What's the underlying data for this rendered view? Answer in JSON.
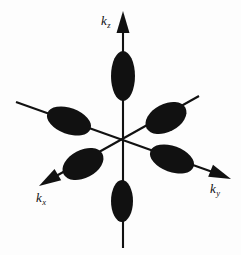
{
  "figure": {
    "background_color": "#fdfdfd",
    "ink_color": "#111111",
    "width": 241,
    "height": 255,
    "origin": {
      "x": 123,
      "y": 142
    }
  },
  "axes": [
    {
      "id": "kz",
      "label_main": "k",
      "label_sub": "z",
      "label_x": 101,
      "label_y": 25,
      "orientation": "vertical",
      "arrow": "up",
      "start": {
        "x": 123,
        "y": 248
      },
      "end": {
        "x": 123,
        "y": 18
      },
      "arrow_tip": {
        "x": 123,
        "y": 11
      }
    },
    {
      "id": "ky",
      "label_main": "k",
      "label_sub": "y",
      "label_x": 210,
      "label_y": 193,
      "orientation": "diagonal-down-right",
      "arrow": "down-right",
      "start": {
        "x": 16,
        "y": 102
      },
      "end": {
        "x": 221,
        "y": 175
      },
      "arrow_tip": {
        "x": 231,
        "y": 179
      }
    },
    {
      "id": "kx",
      "label_main": "k",
      "label_sub": "x",
      "label_x": 36,
      "label_y": 202,
      "orientation": "diagonal-down-left",
      "arrow": "down-left",
      "start": {
        "x": 199,
        "y": 96
      },
      "end": {
        "x": 49,
        "y": 180
      },
      "arrow_tip": {
        "x": 39,
        "y": 186
      }
    }
  ],
  "chart_data": {
    "type": "scatter",
    "xlabel": "k_y",
    "ylabel": "k_z",
    "zlabel": "k_x",
    "grid": false,
    "legend": false,
    "pockets": [
      {
        "name": "kz-positive-pocket",
        "axis": "kz",
        "sign": "+",
        "cx": 123,
        "cy": 76,
        "rx": 12,
        "ry": 25,
        "rotation": 0
      },
      {
        "name": "kz-negative-pocket",
        "axis": "kz",
        "sign": "-",
        "cx": 122,
        "cy": 201,
        "rx": 11,
        "ry": 21,
        "rotation": 0
      },
      {
        "name": "ky-negative-pocket",
        "axis": "ky",
        "sign": "-",
        "cx": 69,
        "cy": 121,
        "rx": 23,
        "ry": 13,
        "rotation": 20
      },
      {
        "name": "ky-positive-pocket",
        "axis": "ky",
        "sign": "+",
        "cx": 172,
        "cy": 159,
        "rx": 23,
        "ry": 13,
        "rotation": 20
      },
      {
        "name": "kx-positive-pocket",
        "axis": "kx",
        "sign": "+",
        "cx": 166,
        "cy": 118,
        "rx": 22,
        "ry": 14,
        "rotation": -28
      },
      {
        "name": "kx-negative-pocket",
        "axis": "kx",
        "sign": "-",
        "cx": 83,
        "cy": 164,
        "rx": 22,
        "ry": 14,
        "rotation": -28
      }
    ]
  }
}
